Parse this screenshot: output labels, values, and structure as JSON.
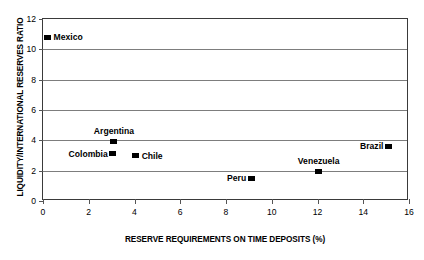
{
  "chart_data": {
    "type": "scatter",
    "title": "",
    "xlabel": "RESERVE REQUIREMENTS ON TIME DEPOSITS (%)",
    "ylabel": "LIQUIDITY/INTERNATIONAL RESERVES RATIO",
    "xlim": [
      0,
      16
    ],
    "ylim": [
      0,
      12
    ],
    "xticks": [
      0,
      2,
      4,
      6,
      8,
      10,
      12,
      14,
      16
    ],
    "yticks": [
      0,
      2,
      4,
      6,
      8,
      10,
      12
    ],
    "xtick_labels": [
      "0",
      "2",
      "4",
      "6",
      "8",
      "10",
      "12",
      "14",
      "16"
    ],
    "ytick_labels": [
      "0",
      "2",
      "4",
      "6",
      "8",
      "10",
      "12"
    ],
    "grid": "horizontal",
    "gridlines_y": [
      2,
      4,
      6,
      8,
      10
    ],
    "legend": "none",
    "marker_color": "#000000",
    "marker_shape": "square",
    "points": [
      {
        "label": "Mexico",
        "x": 0.2,
        "y": 10.8,
        "label_pos": "right"
      },
      {
        "label": "Argentina",
        "x": 3.1,
        "y": 3.95,
        "label_pos": "above"
      },
      {
        "label": "Colombia",
        "x": 3.05,
        "y": 3.1,
        "label_pos": "left"
      },
      {
        "label": "Chile",
        "x": 4.05,
        "y": 3.0,
        "label_pos": "right"
      },
      {
        "label": "Peru",
        "x": 9.1,
        "y": 1.5,
        "label_pos": "left"
      },
      {
        "label": "Venezuela",
        "x": 12.05,
        "y": 1.95,
        "label_pos": "above"
      },
      {
        "label": "Brazil",
        "x": 15.1,
        "y": 3.6,
        "label_pos": "left"
      }
    ]
  }
}
